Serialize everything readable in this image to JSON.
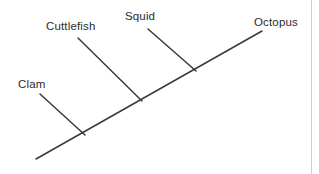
{
  "figure": {
    "width": 319,
    "height": 174,
    "background_color": "#ffffff",
    "line_color": "#3a3a3a",
    "text_color": "#2b2b2b",
    "scan_edge_color": "#cfcfcf",
    "scan_edge_x": 311
  },
  "chart_data": {
    "type": "diagram",
    "diagram_type": "cladogram",
    "title": "",
    "xlabel": "",
    "ylabel": "",
    "taxa": [
      "Clam",
      "Cuttlefish",
      "Squid",
      "Octopus"
    ],
    "branches": [
      {
        "taxon": "Clam",
        "tip": {
          "x": 40,
          "y": 94
        },
        "node": {
          "x": 85,
          "y": 135
        }
      },
      {
        "taxon": "Cuttlefish",
        "tip": {
          "x": 78,
          "y": 38
        },
        "node": {
          "x": 142,
          "y": 101
        }
      },
      {
        "taxon": "Squid",
        "tip": {
          "x": 148,
          "y": 29
        },
        "node": {
          "x": 196,
          "y": 71
        }
      },
      {
        "taxon": "Octopus",
        "tip": {
          "x": 262,
          "y": 31
        },
        "node": {
          "x": 196,
          "y": 71
        }
      }
    ],
    "backbone": {
      "root": {
        "x": 36,
        "y": 159
      },
      "end": {
        "x": 262,
        "y": 31
      }
    },
    "nodes": [
      {
        "name": "clam-split",
        "x": 85,
        "y": 135
      },
      {
        "name": "cuttlefish-split",
        "x": 142,
        "y": 101
      },
      {
        "name": "squid-octopus-split",
        "x": 196,
        "y": 71
      }
    ]
  },
  "labels": {
    "clam": {
      "text": "Clam",
      "x": 18,
      "y": 78
    },
    "cuttlefish": {
      "text": "Cuttlefish",
      "x": 46,
      "y": 20
    },
    "squid": {
      "text": "Squid",
      "x": 125,
      "y": 10
    },
    "octopus": {
      "text": "Octopus",
      "x": 254,
      "y": 16
    }
  }
}
